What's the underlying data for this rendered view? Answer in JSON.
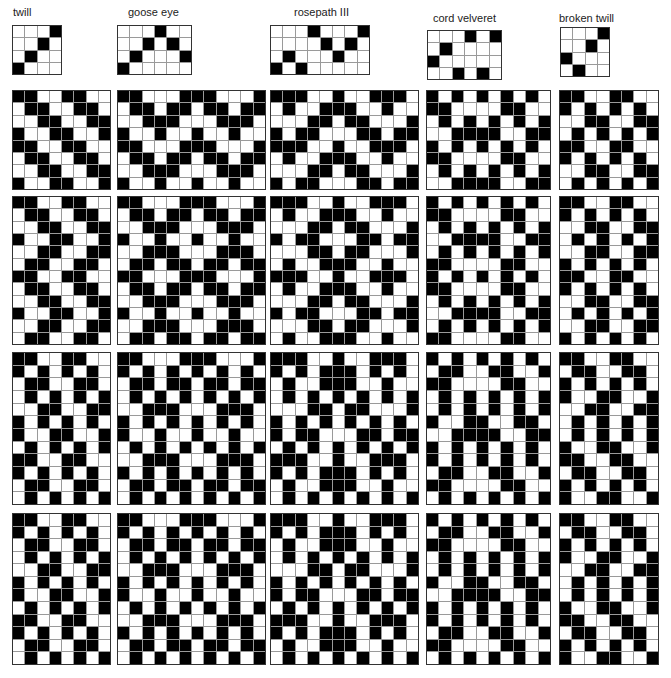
{
  "colors": {
    "filled": "#000000",
    "empty": "#ffffff",
    "gridline": "#9a9a9a"
  },
  "drafts": [
    {
      "id": "twill",
      "label": "twill",
      "label_x": 13,
      "label_y": 6,
      "x": 12,
      "y": 25,
      "cell": 12.5,
      "pattern": [
        "0001",
        "0010",
        "0100",
        "1000"
      ]
    },
    {
      "id": "goose-eye",
      "label": "goose eye",
      "label_x": 128,
      "label_y": 6,
      "x": 117,
      "y": 25,
      "cell": 12.5,
      "pattern": [
        "000100",
        "001010",
        "010001",
        "100000"
      ]
    },
    {
      "id": "rosepath-iii",
      "label": "rosepath III",
      "label_x": 294,
      "label_y": 6,
      "x": 270,
      "y": 25,
      "cell": 12.5,
      "pattern": [
        "00010001",
        "00001010",
        "01000100",
        "10100000"
      ]
    },
    {
      "id": "cord-velveret",
      "label": "cord velveret",
      "label_x": 433,
      "label_y": 12,
      "x": 427,
      "y": 30,
      "cell": 12.5,
      "pattern": [
        "000101",
        "010000",
        "100000",
        "001010"
      ]
    },
    {
      "id": "broken-twill",
      "label": "broken twill",
      "label_x": 559,
      "label_y": 12,
      "x": 560,
      "y": 27,
      "cell": 12.5,
      "pattern": [
        "0001",
        "0010",
        "1000",
        "0100"
      ]
    }
  ],
  "blocks": [
    {
      "row": 1,
      "col": "twill",
      "x": 12,
      "y": 90,
      "w": 99,
      "h": 100,
      "pattern": [
        "11001100",
        "01100110",
        "00110011",
        "10011001",
        "11001100",
        "01100110",
        "00110011",
        "10011001"
      ]
    },
    {
      "row": 1,
      "col": "goose-eye",
      "x": 117,
      "y": 90,
      "w": 149,
      "h": 100,
      "pattern": [
        "110001110001",
        "011011011011",
        "001110001110",
        "100100100100",
        "110001110001",
        "011011011011",
        "001110001110",
        "100100100100"
      ]
    },
    {
      "row": 1,
      "col": "rosepath-iii",
      "x": 270,
      "y": 90,
      "w": 149,
      "h": 100,
      "pattern": [
        "111001001110",
        "010011100100",
        "000110110001",
        "101100011011",
        "111001001110",
        "010011100100",
        "000110110001",
        "101100011011"
      ]
    },
    {
      "row": 1,
      "col": "cord-velveret",
      "x": 426,
      "y": 90,
      "w": 125,
      "h": 100,
      "pattern": [
        "1010101010",
        "1100001100",
        "0101010101",
        "0011110011",
        "1010101010",
        "1100001100",
        "0101010101",
        "0011110011"
      ]
    },
    {
      "row": 1,
      "col": "broken-twill",
      "x": 559,
      "y": 90,
      "w": 100,
      "h": 100,
      "pattern": [
        "11001100",
        "10101010",
        "00110011",
        "01010101",
        "11001100",
        "10101010",
        "00110011",
        "01010101"
      ]
    },
    {
      "row": 2,
      "col": "twill",
      "x": 12,
      "y": 196,
      "w": 99,
      "h": 149,
      "pattern": [
        "11001100",
        "01100110",
        "00110011",
        "10011001",
        "00110011",
        "01100110",
        "11001100",
        "01100110",
        "00110011",
        "10011001",
        "00110011",
        "01100110"
      ]
    },
    {
      "row": 2,
      "col": "goose-eye",
      "x": 117,
      "y": 196,
      "w": 149,
      "h": 149,
      "pattern": [
        "110001110001",
        "011011011011",
        "001110001110",
        "100100100100",
        "001110001110",
        "011011011011",
        "110001110001",
        "011011011011",
        "001110001110",
        "100100100100",
        "001110001110",
        "011011011011"
      ]
    },
    {
      "row": 2,
      "col": "rosepath-iii",
      "x": 270,
      "y": 196,
      "w": 149,
      "h": 149,
      "pattern": [
        "111001001110",
        "010011100100",
        "000110110001",
        "101100011011",
        "000110110001",
        "010011100100",
        "111001001110",
        "010011100100",
        "000110110001",
        "101100011011",
        "000110110001",
        "010011100100"
      ]
    },
    {
      "row": 2,
      "col": "cord-velveret",
      "x": 426,
      "y": 196,
      "w": 125,
      "h": 149,
      "pattern": [
        "1010101010",
        "1100001100",
        "0101010101",
        "0011110011",
        "0101010101",
        "1100001100",
        "1010101010",
        "1100001100",
        "0101010101",
        "0011110011",
        "0101010101",
        "1100001100"
      ]
    },
    {
      "row": 2,
      "col": "broken-twill",
      "x": 559,
      "y": 196,
      "w": 100,
      "h": 149,
      "pattern": [
        "11001100",
        "10101010",
        "00110011",
        "01010101",
        "00110011",
        "10101010",
        "11001100",
        "10101010",
        "00110011",
        "01010101",
        "00110011",
        "10101010"
      ]
    },
    {
      "row": 3,
      "col": "twill",
      "x": 12,
      "y": 352,
      "w": 99,
      "h": 153,
      "pattern": [
        "11001100",
        "10101010",
        "01100110",
        "01010101",
        "00110011",
        "10101010",
        "10011001",
        "01010101",
        "11001100",
        "10101010",
        "01100110",
        "01010101"
      ]
    },
    {
      "row": 3,
      "col": "goose-eye",
      "x": 117,
      "y": 352,
      "w": 149,
      "h": 153,
      "pattern": [
        "110001110001",
        "101010101010",
        "011011011011",
        "010101010101",
        "001110001110",
        "101010101010",
        "100100100100",
        "010101010101",
        "001110001110",
        "101010101010",
        "011011011011",
        "010101010101"
      ]
    },
    {
      "row": 3,
      "col": "rosepath-iii",
      "x": 270,
      "y": 352,
      "w": 149,
      "h": 153,
      "pattern": [
        "111001001110",
        "101011101010",
        "010011100100",
        "010101010101",
        "000110110001",
        "101010101010",
        "101100011011",
        "010101010101",
        "111001001110",
        "101011101010",
        "010011100100",
        "010101010101"
      ]
    },
    {
      "row": 3,
      "col": "cord-velveret",
      "x": 426,
      "y": 352,
      "w": 125,
      "h": 153,
      "pattern": [
        "1010101010",
        "0110011001",
        "1100001100",
        "0101010101",
        "0101010101",
        "1001100110",
        "0011110011",
        "1010101010",
        "1010101010",
        "0110011001",
        "1100001100",
        "0101010101"
      ]
    },
    {
      "row": 3,
      "col": "broken-twill",
      "x": 559,
      "y": 352,
      "w": 100,
      "h": 153,
      "pattern": [
        "11001100",
        "01100110",
        "10101010",
        "10011001",
        "00110011",
        "01010101",
        "01010101",
        "10011001",
        "11001100",
        "01100110",
        "10101010",
        "10011001"
      ]
    },
    {
      "row": 4,
      "col": "twill",
      "x": 12,
      "y": 513,
      "w": 99,
      "h": 152,
      "pattern": [
        "11001100",
        "10101010",
        "01100110",
        "01010101",
        "00110011",
        "10101010",
        "10011001",
        "01010101",
        "11001100",
        "10101010",
        "01100110",
        "01010101"
      ]
    },
    {
      "row": 4,
      "col": "goose-eye",
      "x": 117,
      "y": 513,
      "w": 149,
      "h": 152,
      "pattern": [
        "110001110001",
        "101010101010",
        "011011011011",
        "010101010101",
        "001110001110",
        "101010101010",
        "100100100100",
        "010101010101",
        "001110001110",
        "101010101010",
        "011011011011",
        "010101010101"
      ]
    },
    {
      "row": 4,
      "col": "rosepath-iii",
      "x": 270,
      "y": 513,
      "w": 149,
      "h": 152,
      "pattern": [
        "111001001110",
        "101011101010",
        "010011100100",
        "010101010101",
        "000110110001",
        "101010101010",
        "101100011011",
        "010101010101",
        "111001001110",
        "101011101010",
        "010011100100",
        "010101010101"
      ]
    },
    {
      "row": 4,
      "col": "cord-velveret",
      "x": 426,
      "y": 513,
      "w": 125,
      "h": 152,
      "pattern": [
        "1010101010",
        "0110011001",
        "1100001100",
        "0101010101",
        "0101010101",
        "1001100110",
        "0011110011",
        "1010101010",
        "1010101010",
        "0110011001",
        "1100001100",
        "0101010101"
      ]
    },
    {
      "row": 4,
      "col": "broken-twill",
      "x": 559,
      "y": 513,
      "w": 100,
      "h": 152,
      "pattern": [
        "11001100",
        "01100110",
        "10101010",
        "10011001",
        "00110011",
        "01010101",
        "01010101",
        "10011001",
        "11001100",
        "01100110",
        "10101010",
        "10011001"
      ]
    }
  ]
}
